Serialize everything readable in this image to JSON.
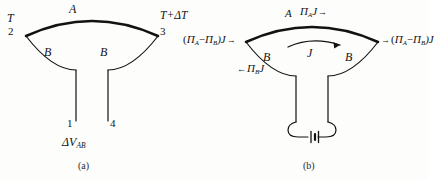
{
  "figure": {
    "background_color": "#fdfdfc",
    "ink_color": "#121212",
    "panels": [
      {
        "id": "a",
        "caption": "(a)",
        "description": "Thermocouple loop of conductors A and B with junctions at temperatures T and T+dT, open terminals 1 and 4 showing thermoelectric voltage",
        "labels": {
          "arc_top": "A",
          "arc_left_lower": "B",
          "arc_right_lower": "B",
          "temp_left": "T",
          "temp_right": "T+ΔT",
          "node_left": "2",
          "node_right": "3",
          "terminal_left": "1",
          "terminal_right": "4",
          "voltage": "ΔV",
          "voltage_sub": "AB"
        }
      },
      {
        "id": "b",
        "caption": "(b)",
        "description": "Peltier circuit: current J driven by a battery through conductors A and B, with heat flux terms at each junction",
        "labels": {
          "arc_top": "A",
          "arc_left_lower": "B",
          "arc_right_lower": "B",
          "top_flux": "Π",
          "top_flux_sub": "A",
          "top_flux_tail": "J",
          "top_flux_arrow": "→",
          "left_flux_open": "(",
          "left_flux_pa": "Π",
          "left_flux_pa_sub": "A",
          "left_flux_minus": "−",
          "left_flux_pb": "Π",
          "left_flux_pb_sub": "B",
          "left_flux_close": ")J",
          "left_flux_arrow": "→",
          "right_flux_arrow": "→",
          "right_flux_open": "(",
          "right_flux_pa": "Π",
          "right_flux_pa_sub": "A",
          "right_flux_minus": "−",
          "right_flux_pb": "Π",
          "right_flux_pb_sub": "B",
          "right_flux_close": ")J",
          "lower_flux_arrow": "←",
          "lower_flux_pb": "Π",
          "lower_flux_pb_sub": "B",
          "lower_flux_tail": "J",
          "current": "J",
          "battery": "battery-symbol"
        }
      }
    ]
  }
}
